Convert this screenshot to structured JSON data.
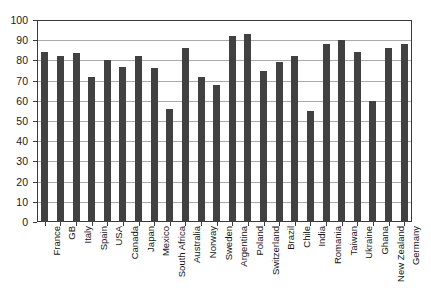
{
  "chart_data": {
    "type": "bar",
    "title": "",
    "subtitle": "",
    "xlabel": "",
    "ylabel": "",
    "ylim": [
      0,
      100
    ],
    "ytick_step": 10,
    "yticks": [
      0,
      10,
      20,
      30,
      40,
      50,
      60,
      70,
      80,
      90,
      100
    ],
    "ytick_labels": [
      "0",
      "10",
      "20",
      "30",
      "40",
      "50",
      "60",
      "70",
      "80",
      "90",
      "100"
    ],
    "grid": true,
    "grid_axis": "y",
    "legend": false,
    "legend_position": "none",
    "bar_color": "#414141",
    "grid_color": "#a9a9a9",
    "axis_color": "#3a3a3a",
    "background_color": "#ffffff",
    "categories": [
      "France",
      "GB",
      "Italy",
      "Spain",
      "USA",
      "Canada",
      "Japan",
      "Mexico",
      "South Africa",
      "Australia",
      "Norway",
      "Sweden",
      "Argentina",
      "Poland",
      "Switzerland",
      "Brazil",
      "Chile",
      "India",
      "Romania",
      "Taiwan",
      "Ukraine",
      "Ghana",
      "New Zealand",
      "Germany"
    ],
    "values": [
      84,
      82,
      83.5,
      72,
      80,
      76.5,
      82,
      76,
      56,
      86,
      72,
      68,
      92,
      93,
      75,
      79,
      82,
      55,
      88,
      90,
      84,
      60,
      86,
      88
    ]
  }
}
